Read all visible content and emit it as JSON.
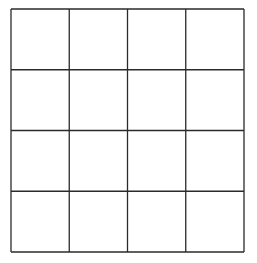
{
  "diagram": {
    "type": "grid",
    "rows": 4,
    "columns": 4,
    "cells": [
      [
        "",
        "",
        "",
        ""
      ],
      [
        "",
        "",
        "",
        ""
      ],
      [
        "",
        "",
        "",
        ""
      ],
      [
        "",
        "",
        "",
        ""
      ]
    ],
    "line_color": "#2a2a2a",
    "background_color": "#ffffff"
  }
}
